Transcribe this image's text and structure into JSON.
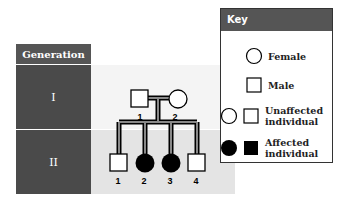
{
  "generation_table": {
    "header": "Generation",
    "rows": [
      {
        "label": "I"
      },
      {
        "label": "II"
      }
    ]
  },
  "pedigree": {
    "generation_I": [
      {
        "id": "1",
        "sex": "male",
        "affected": false
      },
      {
        "id": "2",
        "sex": "female",
        "affected": false
      }
    ],
    "generation_II": [
      {
        "id": "1",
        "sex": "male",
        "affected": false
      },
      {
        "id": "2",
        "sex": "female",
        "affected": true
      },
      {
        "id": "3",
        "sex": "female",
        "affected": true
      },
      {
        "id": "4",
        "sex": "male",
        "affected": false
      }
    ]
  },
  "key": {
    "title": "Key",
    "items": [
      {
        "label": "Female",
        "symbol": "circle-icon"
      },
      {
        "label": "Male",
        "symbol": "square-icon"
      },
      {
        "label_line1": "Unaffected",
        "label_line2": "individual",
        "symbol": "open-circle-square-icon"
      },
      {
        "label_line1": "Affected",
        "label_line2": "individual",
        "symbol": "filled-circle-square-icon"
      }
    ]
  },
  "colors": {
    "header_bg": "#4a4a4a",
    "band1": "#f4f4f4",
    "band2": "#e4e4e4",
    "affected": "#000000"
  }
}
